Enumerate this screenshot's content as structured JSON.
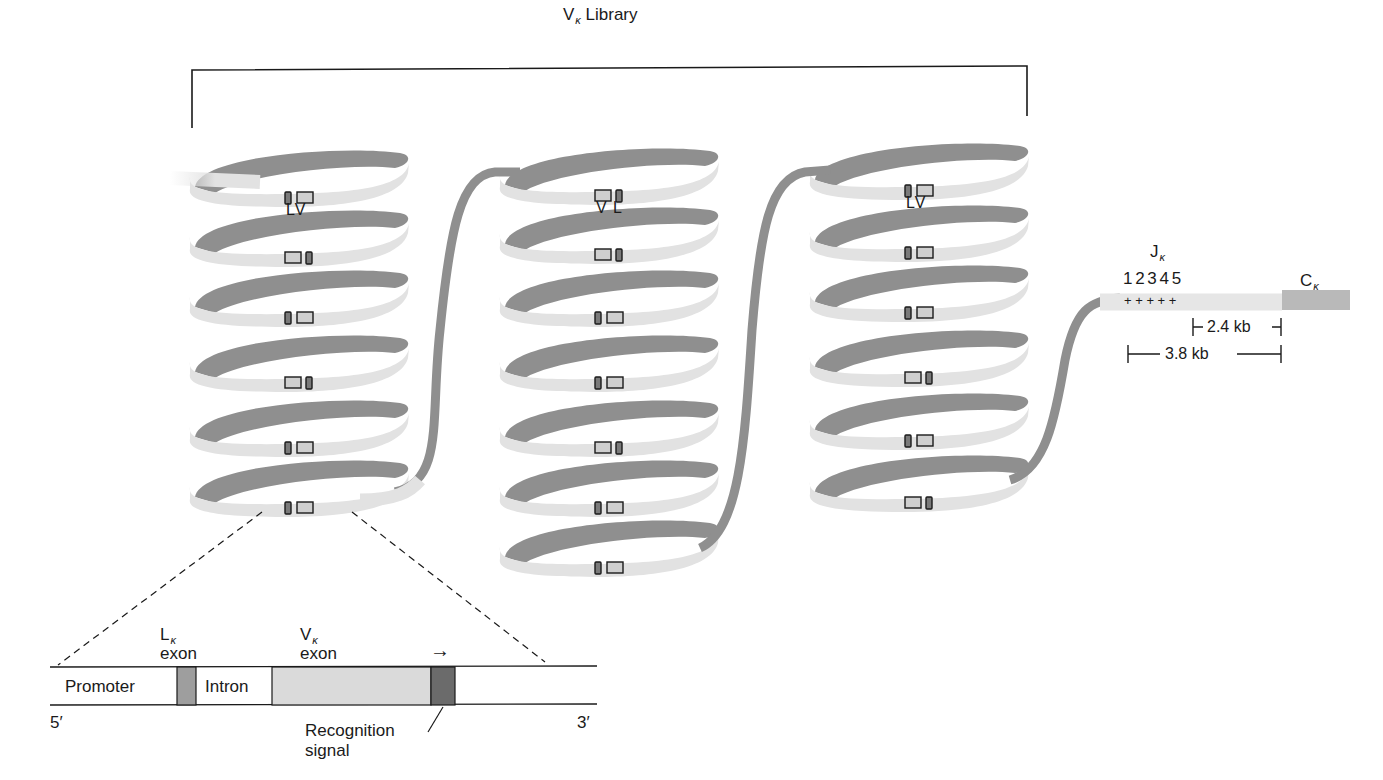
{
  "title": {
    "main": "V",
    "sub": "κ",
    "rest": " Library"
  },
  "colors": {
    "ribbon_front": "#e2e2e2",
    "ribbon_back": "#8f8f8f",
    "l_exon": "#7a7a7a",
    "v_exon": "#cfcfcf",
    "c_kappa": "#b9b9b9",
    "recognition_signal": "#6b6b6b",
    "outline": "#1a1a1a"
  },
  "coils": [
    {
      "name": "coil-1",
      "cx": 305,
      "loops": [
        185,
        245,
        305,
        370,
        435,
        495
      ],
      "markers": [
        "LV",
        "VL",
        "LV",
        "VL",
        "LV",
        "LV"
      ],
      "label": "LV",
      "label_y": 202
    },
    {
      "name": "coil-2",
      "cx": 615,
      "loops": [
        183,
        242,
        305,
        370,
        435,
        495,
        555
      ],
      "markers": [
        "VL",
        "VL",
        "LV",
        "LV",
        "VL",
        "LV",
        "LV"
      ],
      "label": "V L",
      "label_y": 200
    },
    {
      "name": "coil-3",
      "cx": 925,
      "loops": [
        178,
        240,
        300,
        365,
        428,
        490
      ],
      "markers": [
        "LV",
        "LV",
        "LV",
        "VL",
        "LV",
        "VL"
      ],
      "label": "LV",
      "label_y": 195
    }
  ],
  "j_region": {
    "label_main": "J",
    "label_sub": "κ",
    "numbers": "1 2 3 4 5",
    "plus_marks": "+ + + + +",
    "c_label_main": "C",
    "c_label_sub": "κ",
    "distance_short": "2.4 kb",
    "distance_long": "3.8 kb"
  },
  "detail": {
    "l_exon_main": "L",
    "l_exon_sub": "κ",
    "l_exon_word": "exon",
    "v_exon_main": "V",
    "v_exon_sub": "κ",
    "v_exon_word": "exon",
    "arrow": "→",
    "promoter": "Promoter",
    "intron": "Intron",
    "five_prime": "5′",
    "three_prime": "3′",
    "recognition_line1": "Recognition",
    "recognition_line2": "signal"
  }
}
